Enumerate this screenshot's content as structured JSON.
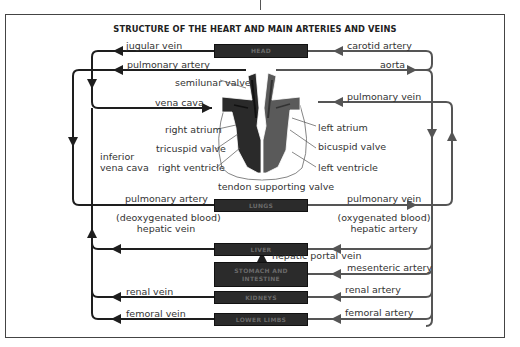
{
  "title": "STRUCTURE OF THE HEART AND MAIN ARTERIES AND VEINS",
  "colors": {
    "vein_line": "#1e1e1e",
    "artery_line": "#555555",
    "organ_box": "#2b2b2b",
    "right_heart": "#2a2a2a",
    "left_heart": "#5a5a5a",
    "frame": "#444444"
  },
  "organs": {
    "head": "HEAD",
    "lungs": "LUNGS",
    "liver": "LIVER",
    "stomach": "STOMACH AND INTESTINE",
    "kidneys": "KIDNEYS",
    "lower_limbs": "LOWER LIMBS"
  },
  "vessels_left": {
    "jugular_vein": "jugular vein",
    "pulmonary_artery_top": "pulmonary artery",
    "vena_cava": "vena cava",
    "inferior_vena_cava_1": "inferior",
    "inferior_vena_cava_2": "vena cava",
    "pulmonary_artery_lungs": "pulmonary artery",
    "deoxygenated": "(deoxygenated blood)",
    "hepatic_vein": "hepatic vein",
    "renal_vein": "renal vein",
    "femoral_vein": "femoral vein"
  },
  "vessels_right": {
    "carotid_artery": "carotid artery",
    "aorta": "aorta",
    "pulmonary_vein_top": "pulmonary vein",
    "pulmonary_vein_lungs": "pulmonary vein",
    "oxygenated": "(oxygenated blood)",
    "hepatic_artery": "hepatic artery",
    "hepatic_portal_vein": "hepatic portal vein",
    "mesenteric_artery": "mesenteric artery",
    "renal_artery": "renal artery",
    "femoral_artery": "femoral artery"
  },
  "heart_parts": {
    "semilunar_valve": "semilunar valve",
    "right_atrium": "right atrium",
    "tricuspid_valve": "tricuspid valve",
    "right_ventricle": "right ventricle",
    "left_atrium": "left atrium",
    "bicuspid_valve": "bicuspid valve",
    "left_ventricle": "left ventricle",
    "tendon_supporting_valve": "tendon supporting valve"
  }
}
